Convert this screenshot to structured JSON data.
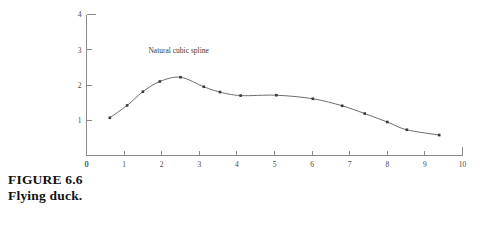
{
  "figure": {
    "caption_label": "FIGURE 6.6",
    "caption_text": "Flying duck."
  },
  "chart_data": {
    "type": "line",
    "title": "",
    "subtitle": "",
    "xlabel": "",
    "ylabel": "",
    "xlim": [
      0,
      10
    ],
    "ylim": [
      0,
      4
    ],
    "grid": false,
    "legend": null,
    "x_ticks": [
      0,
      1,
      2,
      3,
      4,
      5,
      6,
      7,
      8,
      9,
      10
    ],
    "x_tick_labels": [
      "0",
      "1",
      "2",
      "3",
      "4",
      "5",
      "6",
      "7",
      "8",
      "9",
      "10"
    ],
    "y_ticks": [
      0,
      1,
      2,
      3,
      4
    ],
    "y_tick_labels": [
      "0",
      "1",
      "2",
      "3",
      "4"
    ],
    "annotations": [
      {
        "text": "Natural cubic spline",
        "x": 2.45,
        "y": 2.92
      }
    ],
    "series": [
      {
        "name": "Natural cubic spline",
        "marker": "dot",
        "color": "#6d6d6d",
        "x": [
          0.62,
          1.08,
          1.5,
          1.95,
          2.5,
          3.12,
          3.55,
          4.1,
          5.05,
          6.02,
          6.8,
          7.4,
          8.0,
          8.52,
          9.38
        ],
        "y": [
          1.07,
          1.42,
          1.81,
          2.1,
          2.22,
          1.95,
          1.8,
          1.7,
          1.71,
          1.61,
          1.41,
          1.19,
          0.95,
          0.73,
          0.58
        ]
      }
    ]
  }
}
